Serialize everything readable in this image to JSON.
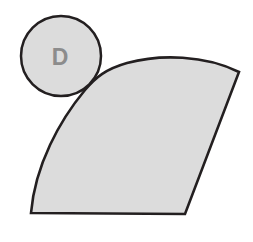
{
  "figure": {
    "background_color": "#ffffff",
    "canvas": {
      "width": 253,
      "height": 242
    },
    "style": {
      "fill_color": "#dcdcdc",
      "stroke_color": "#231f20",
      "stroke_width": 2.6,
      "label_color": "#8c8c8c"
    },
    "circle": {
      "name": "labelled-circle",
      "label": "D",
      "center_x": 61,
      "center_y": 56,
      "radius": 40,
      "fill_color": "#dcdcdc",
      "stroke_color": "#231f20"
    },
    "sector": {
      "name": "shaded-sector",
      "fill_color": "#dcdcdc",
      "stroke_color": "#231f20",
      "path": "M 31 213 L 185 214 L 239 72 C 205 55 160 54 127 63 C 106 69 96 77 85 90 C 60 120 35 165 31 213 Z",
      "vertices": [
        {
          "name": "bottom-left-corner",
          "x": 31,
          "y": 213
        },
        {
          "name": "bottom-right-corner",
          "x": 185,
          "y": 214
        },
        {
          "name": "top-right-corner",
          "x": 239,
          "y": 72
        }
      ],
      "edges": [
        {
          "name": "bottom-edge",
          "type": "line"
        },
        {
          "name": "right-edge",
          "type": "line"
        },
        {
          "name": "top-arc",
          "type": "arc-convex"
        },
        {
          "name": "left-arc",
          "type": "arc-concave"
        }
      ]
    },
    "watermarks": [
      {
        "text": "HAND",
        "x": 166,
        "y": 74,
        "rotate": 180,
        "size": 26
      },
      {
        "text": "IND",
        "x": 124,
        "y": 128,
        "rotate": 180,
        "size": 28
      },
      {
        "text": "DIG",
        "x": 120,
        "y": 183,
        "rotate": 180,
        "size": 26
      }
    ]
  }
}
